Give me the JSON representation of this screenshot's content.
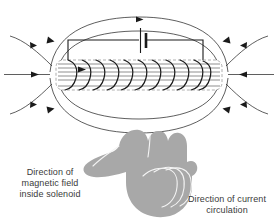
{
  "figure": {
    "type": "physics-diagram",
    "background_color": "#ffffff",
    "line_color": "#1a1a1a",
    "hand_color": "#a8a8a8",
    "text_color": "#3a3a3a"
  },
  "captions": {
    "left": {
      "name": "magnetic-field-caption",
      "text": "Direction of\nmagnetic field\ninside solenoid",
      "lines": [
        "Direction of",
        "magnetic field",
        "inside solenoid"
      ]
    },
    "right": {
      "name": "current-direction-caption",
      "text": "Direction of current\ncirculation",
      "lines": [
        "Direction of current",
        "circulation"
      ]
    }
  },
  "components": {
    "battery": {
      "label": "battery-cell",
      "description": "DC cell symbol with long positive plate and short negative plate",
      "x": 142,
      "y": 40
    },
    "solenoid": {
      "label": "solenoid-coil",
      "turns": 11,
      "interior_field_lines": 6,
      "interior_arrow_direction": "right",
      "x": 56,
      "y": 60,
      "width": 166,
      "height": 30
    },
    "circuit": {
      "label": "circuit-wires",
      "left_terminal_x": 68,
      "right_terminal_x": 203,
      "top_wire_y": 40
    },
    "hand": {
      "label": "right-hand-silhouette",
      "thumb_direction": "left",
      "fingers": "curled",
      "color": "#a8a8a8"
    }
  },
  "field_lines": {
    "inside_direction": "right",
    "outside_direction": "right-to-left looping around",
    "arrow_count": 9,
    "axis_arrows": [
      {
        "name": "left-axis-arrow",
        "x": 34,
        "y": 74,
        "direction": "right"
      },
      {
        "name": "right-axis-arrow",
        "x": 243,
        "y": 74,
        "direction": "left"
      }
    ],
    "loop_arrows": [
      {
        "name": "top-center-arrow",
        "direction": "right"
      },
      {
        "name": "bottom-center-arrow",
        "direction": "right"
      },
      {
        "name": "top-left-arrow",
        "direction": "down-right"
      },
      {
        "name": "top-right-arrow",
        "direction": "down-left"
      },
      {
        "name": "bottom-left-arrow",
        "direction": "up-right"
      },
      {
        "name": "bottom-right-arrow",
        "direction": "up-left"
      }
    ]
  }
}
